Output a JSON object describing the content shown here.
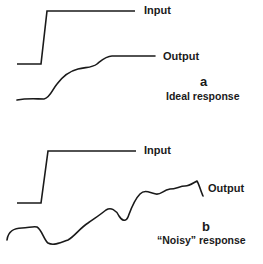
{
  "panel_a": {
    "input_label": "Input",
    "output_label": "Output",
    "letter": "a",
    "caption": "Ideal response"
  },
  "panel_b": {
    "input_label": "Input",
    "output_label": "Output",
    "letter": "b",
    "caption": "“Noisy” response"
  },
  "colors": {
    "line": "#1a1a1a",
    "background": "#ffffff"
  }
}
